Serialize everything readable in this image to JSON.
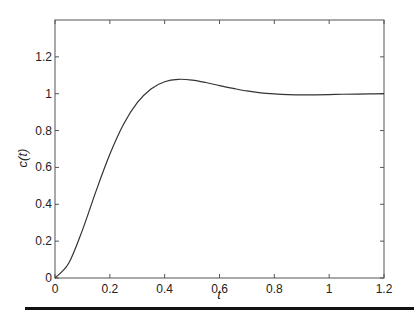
{
  "chart_data": {
    "type": "line",
    "title": "",
    "xlabel": "t",
    "ylabel": "c(t)",
    "xlim": [
      0,
      1.2
    ],
    "ylim": [
      0,
      1.4
    ],
    "grid": false,
    "legend": null,
    "xticks": [
      "0",
      "0.2",
      "0.4",
      "0.6",
      "0.8",
      "1",
      "1.2"
    ],
    "yticks": [
      "0",
      "0.2",
      "0.4",
      "0.6",
      "0.8",
      "1",
      "1.2"
    ],
    "xtick_values": [
      0,
      0.2,
      0.4,
      0.6,
      0.8,
      1.0,
      1.2
    ],
    "ytick_values": [
      0,
      0.2,
      0.4,
      0.6,
      0.8,
      1.0,
      1.2
    ],
    "series": [
      {
        "name": "c(t)",
        "color": "#333333",
        "x": [
          0,
          0.05,
          0.1,
          0.15,
          0.2,
          0.25,
          0.3,
          0.35,
          0.4,
          0.45,
          0.5,
          0.55,
          0.6,
          0.65,
          0.7,
          0.75,
          0.8,
          0.85,
          0.9,
          0.95,
          1.0,
          1.05,
          1.1,
          1.15,
          1.2
        ],
        "y": [
          0,
          0.08,
          0.26,
          0.473,
          0.671,
          0.834,
          0.951,
          1.026,
          1.065,
          1.078,
          1.074,
          1.061,
          1.044,
          1.029,
          1.015,
          1.005,
          0.999,
          0.995,
          0.994,
          0.994,
          0.995,
          0.997,
          0.998,
          0.999,
          1.0
        ]
      }
    ]
  }
}
